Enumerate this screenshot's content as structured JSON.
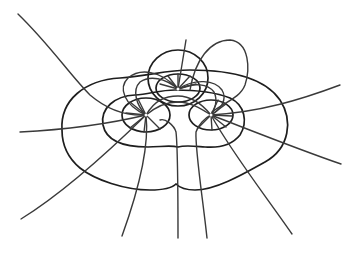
{
  "figure": {
    "type": "field-line-diagram",
    "colors": {
      "background": "#ffffff",
      "level_curves": "#1e1e1e",
      "field_lines": "#3a3a3a"
    },
    "poles": [
      {
        "id": "left",
        "x": 146,
        "y": 115
      },
      {
        "id": "top",
        "x": 178,
        "y": 89
      },
      {
        "id": "right",
        "x": 211,
        "y": 115
      }
    ]
  }
}
